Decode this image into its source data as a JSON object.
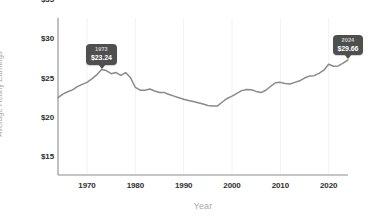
{
  "chart_data": {
    "type": "line",
    "title": "",
    "xlabel": "Year",
    "ylabel": "Average Hourly Earnings",
    "xlim": [
      1964,
      2024
    ],
    "ylim": [
      15,
      35
    ],
    "grid": "vertical-only",
    "legend": "none",
    "line_color": "#8a8a8a",
    "x_ticks": [
      "1970",
      "1980",
      "1990",
      "2000",
      "2010",
      "2020"
    ],
    "x_tick_values": [
      1970,
      1980,
      1990,
      2000,
      2010,
      2020
    ],
    "y_ticks": [
      "$15",
      "$20",
      "$25",
      "$30",
      "$35"
    ],
    "y_tick_values": [
      15,
      20,
      25,
      30,
      35
    ],
    "x": [
      1964,
      1965,
      1966,
      1967,
      1968,
      1969,
      1970,
      1971,
      1972,
      1973,
      1974,
      1975,
      1976,
      1977,
      1978,
      1979,
      1980,
      1981,
      1982,
      1983,
      1984,
      1985,
      1986,
      1987,
      1988,
      1989,
      1990,
      1991,
      1992,
      1993,
      1994,
      1995,
      1996,
      1997,
      1998,
      1999,
      2000,
      2001,
      2002,
      2003,
      2004,
      2005,
      2006,
      2007,
      2008,
      2009,
      2010,
      2011,
      2012,
      2013,
      2014,
      2015,
      2016,
      2017,
      2018,
      2019,
      2020,
      2021,
      2022,
      2023,
      2024
    ],
    "values": [
      24.86,
      25.3,
      25.6,
      25.85,
      26.25,
      26.55,
      26.8,
      27.25,
      27.75,
      28.45,
      28.3,
      27.9,
      28.05,
      27.7,
      28.05,
      27.4,
      26.15,
      25.8,
      25.8,
      25.95,
      25.7,
      25.5,
      25.5,
      25.25,
      25.05,
      24.85,
      24.65,
      24.5,
      24.35,
      24.2,
      24.05,
      23.85,
      23.8,
      23.8,
      24.3,
      24.75,
      25.05,
      25.4,
      25.75,
      25.9,
      25.85,
      25.65,
      25.5,
      25.8,
      26.3,
      26.75,
      26.8,
      26.65,
      26.6,
      26.8,
      27.0,
      27.35,
      27.6,
      27.65,
      27.95,
      28.35,
      29.1,
      28.85,
      28.9,
      29.25,
      29.66
    ],
    "annotations": [
      {
        "name": "peak-1973",
        "year": "1973",
        "value": "$23.24",
        "x": 1973,
        "y": 28.45
      },
      {
        "name": "latest-2024",
        "year": "2024",
        "value": "$29.66",
        "x": 2024,
        "y": 29.66
      }
    ]
  },
  "axis": {
    "y_title": "Average Hourly Earnings",
    "x_title": "Year"
  }
}
